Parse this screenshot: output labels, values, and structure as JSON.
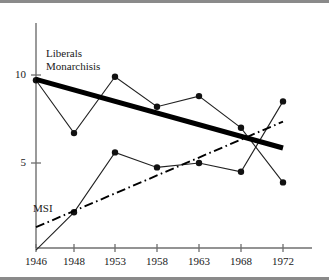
{
  "figure": {
    "name": "election-results-line-chart",
    "frame_color": "#8a8a8a"
  },
  "chart_data": {
    "type": "line",
    "title": "",
    "xlabel": "",
    "ylabel": "",
    "x": [
      1946,
      1948,
      1953,
      1958,
      1963,
      1968,
      1972
    ],
    "categories": [
      "1946",
      "1948",
      "1953",
      "1958",
      "1963",
      "1968",
      "1972"
    ],
    "xlim": [
      1946,
      1972
    ],
    "ylim": [
      0,
      11
    ],
    "yticks": [
      5,
      10
    ],
    "ytick_labels": [
      "5",
      "10"
    ],
    "grid": false,
    "legend_position": "inline-annotation",
    "series": [
      {
        "name": "Liberals Monarchisis",
        "label": "Liberals\nMonarchisis",
        "style": "line-with-markers",
        "color": "#111111",
        "x": [
          1946,
          1948,
          1953,
          1958,
          1963,
          1968,
          1972
        ],
        "values": [
          9.7,
          6.7,
          9.9,
          8.2,
          8.8,
          7.0,
          3.9
        ]
      },
      {
        "name": "MSI",
        "label": "MSI",
        "style": "line-with-markers",
        "color": "#111111",
        "x": [
          1946,
          1948,
          1953,
          1958,
          1963,
          1968,
          1972
        ],
        "values": [
          0.05,
          2.2,
          5.6,
          4.75,
          5.0,
          4.5,
          8.5
        ]
      },
      {
        "name": "Liberals Monarchisis trend",
        "style": "thick-solid-trend",
        "color": "#000000",
        "x": [
          1946,
          1972
        ],
        "values": [
          9.75,
          5.85
        ]
      },
      {
        "name": "MSI trend",
        "style": "dash-dot-trend",
        "color": "#000000",
        "x": [
          1946,
          1972
        ],
        "values": [
          1.35,
          7.35
        ]
      }
    ],
    "annotations": [
      {
        "text": "Liberals",
        "x": 1946.9,
        "y": 11.0
      },
      {
        "text": "Monarchisis",
        "x": 1946.9,
        "y": 10.3
      },
      {
        "text": "MSI",
        "x": 1946.3,
        "y": 2.6
      }
    ]
  },
  "axes": {
    "y_tick_10": "10",
    "y_tick_5": "5",
    "x_ticks": [
      "1946",
      "1948",
      "1953",
      "1958",
      "1963",
      "1968",
      "1972"
    ]
  },
  "labels": {
    "liberals_line1": "Liberals",
    "liberals_line2": "Monarchisis",
    "msi": "MSI"
  }
}
